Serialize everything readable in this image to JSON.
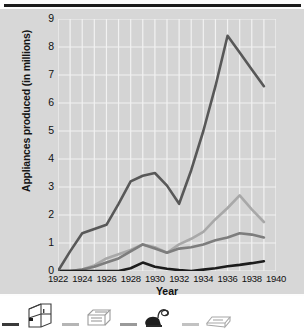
{
  "chart_data": {
    "type": "line",
    "title": "",
    "xlabel": "Year",
    "ylabel": "Appliances produced (in millions)",
    "xlim": [
      1922,
      1940
    ],
    "ylim": [
      0,
      9
    ],
    "xticks": [
      "1922",
      "1924",
      "1926",
      "1928",
      "1930",
      "1932",
      "1934",
      "1936",
      "1938",
      "1940"
    ],
    "yticks": [
      "0",
      "1",
      "2",
      "3",
      "4",
      "5",
      "6",
      "7",
      "8",
      "9"
    ],
    "grid": true,
    "legend_position": "bottom",
    "x": [
      1922,
      1923,
      1924,
      1925,
      1926,
      1927,
      1928,
      1929,
      1930,
      1931,
      1932,
      1933,
      1934,
      1935,
      1936,
      1937,
      1938,
      1939
    ],
    "series": [
      {
        "name": "Refrigerators",
        "color": "#585858",
        "icon": "refrigerator-icon",
        "values": [
          0.0,
          0.7,
          1.35,
          1.5,
          1.65,
          2.4,
          3.2,
          3.4,
          3.5,
          3.05,
          2.4,
          3.6,
          5.0,
          6.6,
          8.4,
          7.8,
          7.2,
          6.6
        ]
      },
      {
        "name": "Washing machines",
        "color": "#a8a8a8",
        "icon": "washing-machine-icon",
        "values": [
          0.0,
          0.0,
          0.05,
          0.2,
          0.45,
          0.6,
          0.75,
          0.95,
          0.85,
          0.65,
          0.95,
          1.15,
          1.4,
          1.85,
          2.25,
          2.7,
          2.2,
          1.75
        ]
      },
      {
        "name": "Vacuum cleaners",
        "color": "#7d7d7d",
        "icon": "vacuum-cleaner-icon",
        "values": [
          0.0,
          0.0,
          0.05,
          0.15,
          0.3,
          0.45,
          0.7,
          0.95,
          0.8,
          0.65,
          0.8,
          0.85,
          0.95,
          1.1,
          1.2,
          1.35,
          1.3,
          1.2
        ]
      },
      {
        "name": "Radios",
        "color": "#1c1c1c",
        "icon": "radio-icon",
        "values": [
          0.0,
          0.0,
          0.0,
          0.0,
          0.0,
          0.0,
          0.1,
          0.3,
          0.15,
          0.08,
          0.03,
          0.0,
          0.05,
          0.1,
          0.17,
          0.22,
          0.28,
          0.35
        ]
      }
    ]
  },
  "legend": {
    "items": [
      {
        "icon": "refrigerator-icon",
        "color": "#3a3a3a"
      },
      {
        "icon": "washing-machine-icon",
        "color": "#b5b5b5"
      },
      {
        "icon": "vacuum-cleaner-icon",
        "color": "#9a9a9a"
      },
      {
        "icon": "radio-icon",
        "color": "#c2c2c2"
      }
    ]
  },
  "style": {
    "plot_background": "#d4d4d4",
    "card_background": "#d7d7d7",
    "gridline_color": "#f2f2f2",
    "rule_color": "#1b1b1b"
  }
}
